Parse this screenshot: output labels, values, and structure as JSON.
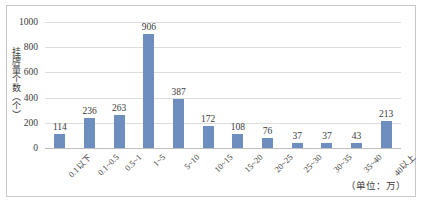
{
  "chart_data": {
    "type": "bar",
    "title": "",
    "subtitle": "",
    "xlabel": "",
    "ylabel": "挂牌量个数（个）",
    "unit_note": "（单位：万）",
    "categories": [
      "0.1以下",
      "0.1~0.5",
      "0.5~1",
      "1~5",
      "5~10",
      "10~15",
      "15~20",
      "20~25",
      "25~30",
      "30~35",
      "35~40",
      "40以上"
    ],
    "values": [
      114,
      236,
      263,
      906,
      387,
      172,
      108,
      76,
      37,
      37,
      43,
      213
    ],
    "ylim": [
      0,
      1000
    ],
    "yticks": [
      1000,
      800,
      600,
      400,
      200,
      0
    ],
    "ytick_labels": [
      "1000",
      "800",
      "600",
      "400",
      "200",
      "0"
    ],
    "grid": "horizontal",
    "legend": "none",
    "data_labels": true,
    "series": [
      {
        "name": "挂牌量个数",
        "color": "#6e8ebf",
        "values": [
          114,
          236,
          263,
          906,
          387,
          172,
          108,
          76,
          37,
          37,
          43,
          213
        ]
      }
    ]
  },
  "colors": {
    "bar": "#6e8ebf",
    "gridline": "#dcdcdc",
    "axis": "#bdbdbd",
    "frame": "#c9c9c9",
    "text": "#3a3a3a",
    "background": "#ffffff"
  }
}
